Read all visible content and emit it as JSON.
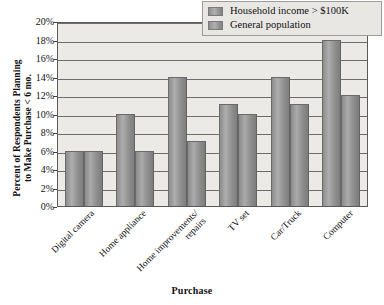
{
  "chart_data": {
    "type": "bar",
    "title": "",
    "xlabel": "Purchase",
    "ylabel_lines": [
      "Percent of Respondents Planning",
      "to Make Purchase < 6 mo."
    ],
    "ylabel": "Percent of Respondents Planning to Make Purchase < 6 mo.",
    "categories": [
      "Digital camera",
      "Home appliance",
      "Home improvements/ repairs",
      "TV set",
      "Car/Truck",
      "Computer"
    ],
    "category_lines": [
      [
        "Digital camera"
      ],
      [
        "Home appliance"
      ],
      [
        "Home improvements/",
        "repairs"
      ],
      [
        "TV set"
      ],
      [
        "Car/Truck"
      ],
      [
        "Computer"
      ]
    ],
    "series": [
      {
        "name": "Household income > $100K",
        "values": [
          6,
          10,
          14,
          11,
          14,
          18
        ]
      },
      {
        "name": "General population",
        "values": [
          6,
          6,
          7,
          10,
          11,
          12
        ]
      }
    ],
    "ylim": [
      0,
      20
    ],
    "ytick_values": [
      0,
      2,
      4,
      6,
      8,
      10,
      12,
      14,
      16,
      18,
      20
    ],
    "ytick_labels": [
      "0%",
      "2%",
      "4%",
      "6%",
      "8%",
      "10%",
      "12%",
      "14%",
      "16%",
      "18%",
      "20%"
    ],
    "grid": true,
    "grid_axis": "y",
    "legend_position": "top-right",
    "value_unit": "%",
    "plot_background": "#eceae7",
    "bar_color": "#9a9a9a",
    "axis_color": "#5a5a5a"
  },
  "legend": {
    "items": [
      {
        "label": "Household income > $100K",
        "swatch": "series-1-swatch"
      },
      {
        "label": "General population",
        "swatch": "series-2-swatch"
      }
    ]
  },
  "axes": {
    "x_title": "Purchase",
    "y_title_line1": "Percent of Respondents Planning",
    "y_title_line2": "to Make Purchase < 6 mo."
  }
}
